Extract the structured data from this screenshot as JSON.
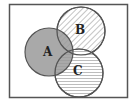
{
  "diagram": {
    "type": "venn",
    "frame": {
      "x": 9,
      "y": 4,
      "width": 119,
      "height": 94,
      "stroke": "#555555"
    },
    "sets": [
      {
        "label": "A",
        "cx": 49,
        "cy": 52,
        "r": 24,
        "fill": "solid-gray",
        "color": "#9a9a9a"
      },
      {
        "label": "B",
        "cx": 81,
        "cy": 31,
        "r": 24,
        "fill": "diagonal-hatch",
        "color": "#b0b0b0"
      },
      {
        "label": "C",
        "cx": 79,
        "cy": 73,
        "r": 24,
        "fill": "horizontal-hatch",
        "color": "#b8b8b8"
      }
    ],
    "stroke_color": "#555555"
  }
}
